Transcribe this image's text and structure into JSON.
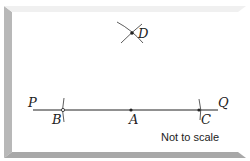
{
  "diagram": {
    "type": "geometric-construction",
    "points": [
      {
        "id": "P",
        "label": "P",
        "x": 30,
        "y": 100
      },
      {
        "id": "Q",
        "label": "Q",
        "x": 222,
        "y": 100
      },
      {
        "id": "B",
        "label": "B",
        "x": 63,
        "y": 110
      },
      {
        "id": "A",
        "label": "A",
        "x": 131,
        "y": 110
      },
      {
        "id": "C",
        "label": "C",
        "x": 199,
        "y": 110
      },
      {
        "id": "D",
        "label": "D",
        "x": 132,
        "y": 33
      }
    ],
    "line": {
      "from": "P",
      "to": "Q"
    },
    "arcs": [
      "arc-through-B",
      "arc-through-C",
      "intersecting-arcs-at-D"
    ],
    "note": "Not to scale",
    "colors": {
      "panel": "#ffffff",
      "bevel": "#b3b3b3",
      "ink": "#222222"
    }
  }
}
